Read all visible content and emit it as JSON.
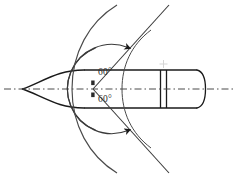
{
  "diagram": {
    "type": "engineering-section-drawing",
    "canvas": {
      "width": 238,
      "height": 179,
      "background": "#ffffff"
    },
    "stroke_color": "#1a1a1a",
    "centerline_color": "#4a4a4a",
    "labels": {
      "upper_angle": "60°",
      "lower_angle": "60°"
    },
    "annotations": {
      "total_included_angle": "120°",
      "apex_x": 93,
      "apex_y": 89
    },
    "parts": [
      {
        "name": "ogive-nose",
        "tip_x": 22,
        "tip_y": 89
      },
      {
        "name": "cylindrical-body"
      },
      {
        "name": "rotating-band"
      },
      {
        "name": "base-cap"
      },
      {
        "name": "axis-centerline"
      },
      {
        "name": "upper-dimension-arc"
      },
      {
        "name": "lower-dimension-arc"
      },
      {
        "name": "outer-reference-arc"
      },
      {
        "name": "upper-angle-leg"
      },
      {
        "name": "lower-angle-leg"
      }
    ],
    "geometry": {
      "body_top_y": 70,
      "body_bottom_y": 110,
      "axis_y": 89,
      "body_right_x": 205,
      "band_x1": 160,
      "band_x2": 167,
      "centerline_left_x": 4,
      "centerline_right_x": 234
    }
  }
}
